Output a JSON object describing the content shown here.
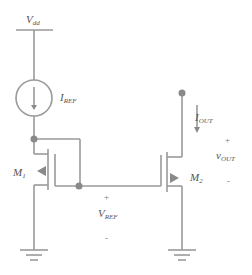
{
  "diagram": {
    "type": "circuit-schematic",
    "title": "",
    "colors": {
      "wire": "#999999",
      "node": "#8a8a8a",
      "text": "#555555"
    },
    "supply": {
      "label": "V",
      "subscript": "dd"
    },
    "current_source": {
      "label": "I",
      "subscript": "REF"
    },
    "output_current": {
      "label": "I",
      "subscript": "OUT"
    },
    "transistor_left": {
      "label": "M",
      "subscript": "1"
    },
    "transistor_right": {
      "label": "M",
      "subscript": "2"
    },
    "v_ref": {
      "label": "V",
      "subscript": "REF",
      "plus": "+",
      "minus": "-"
    },
    "v_out": {
      "label": "v",
      "subscript": "OUT",
      "plus": "+",
      "minus": "-"
    }
  }
}
